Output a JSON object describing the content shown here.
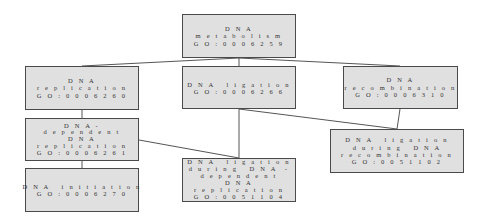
{
  "diagram": {
    "type": "GO term hierarchy",
    "nodes": [
      {
        "id": "metabolism",
        "lines": [
          "D N A",
          "m e t a b o l i s m",
          "G O : 0 0 0 6 2 5 9"
        ],
        "term": "DNA metabolism",
        "go_id": "GO:0006259"
      },
      {
        "id": "replication",
        "lines": [
          "D N A",
          "r e p l i c a t i o n",
          "G O : 0 0 0 6 2 6 0"
        ],
        "term": "DNA replication",
        "go_id": "GO:0006260"
      },
      {
        "id": "ligation",
        "lines": [
          "D N A   l i g a t i o n",
          "G O : 0 0 0 6 2 6 6"
        ],
        "term": "DNA ligation",
        "go_id": "GO:0006266"
      },
      {
        "id": "recombination",
        "lines": [
          "D N A",
          "r e c o m b i n a t i o n",
          "G O : 0 0 0 6 3 1 0"
        ],
        "term": "DNA recombination",
        "go_id": "GO:0006310"
      },
      {
        "id": "dependent",
        "lines": [
          "D N A -",
          "d e p e n d e n t",
          "D N A",
          "r e p l i c a t i o n",
          "G O : 0 0 0 6 2 6 1"
        ],
        "term": "DNA-dependent DNA replication",
        "go_id": "GO:0006261"
      },
      {
        "id": "initiation",
        "lines": [
          "D N A   i n i t i a t i o n",
          "G O : 0 0 0 6 2 7 0"
        ],
        "term": "DNA initiation",
        "go_id": "GO:0006270"
      },
      {
        "id": "lig_dep",
        "lines": [
          "D N A   l i g a t i o n",
          "d u r i n g   D N A  -",
          "d e p e n d e n t",
          "D N A",
          "r e p l i c a t i o n",
          "G O : 0 0 5 1 1 0 4"
        ],
        "term": "DNA ligation during DNA-dependent DNA replication",
        "go_id": "GO:0051104"
      },
      {
        "id": "lig_rec",
        "lines": [
          "D N A   l i g a t i o n",
          "d u r i n g   D N A",
          "r e c o m b i n a t i o n",
          "G O : 0 0 5 1 1 0 2"
        ],
        "term": "DNA ligation during DNA recombination",
        "go_id": "GO:0051102"
      }
    ],
    "edges": [
      [
        "metabolism",
        "replication"
      ],
      [
        "metabolism",
        "ligation"
      ],
      [
        "metabolism",
        "recombination"
      ],
      [
        "replication",
        "dependent"
      ],
      [
        "dependent",
        "initiation"
      ],
      [
        "dependent",
        "lig_dep"
      ],
      [
        "ligation",
        "lig_dep"
      ],
      [
        "ligation",
        "lig_rec"
      ],
      [
        "recombination",
        "lig_rec"
      ]
    ],
    "colors": {
      "node_fill": "#e0e0e0",
      "node_border": "#4a4a4a",
      "edge": "#555555",
      "text": "#333333"
    }
  }
}
